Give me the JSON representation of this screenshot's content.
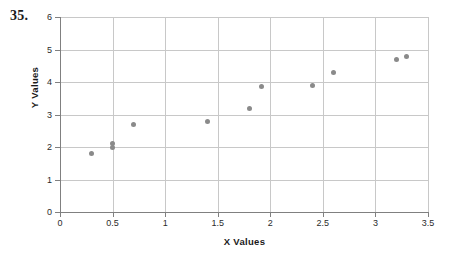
{
  "problem": {
    "number": "35."
  },
  "chart_data": {
    "type": "scatter",
    "title": "",
    "xlabel": "X Values",
    "ylabel": "Y Values",
    "xlim": [
      0,
      3.5
    ],
    "ylim": [
      0,
      6
    ],
    "grid": true,
    "legend": null,
    "marker_color": "#8a8a8a",
    "gridline_color": "#c8c8c8",
    "axis_color": "#808080",
    "xticks": [
      "0",
      "0.5",
      "1",
      "1.5",
      "2",
      "2.5",
      "3",
      "3.5"
    ],
    "xtick_values": [
      0,
      0.5,
      1,
      1.5,
      2,
      2.5,
      3,
      3.5
    ],
    "yticks": [
      "0",
      "1",
      "2",
      "3",
      "4",
      "5",
      "6"
    ],
    "ytick_values": [
      0,
      1,
      2,
      3,
      4,
      5,
      6
    ],
    "points": [
      {
        "x": 0.3,
        "y": 1.8
      },
      {
        "x": 0.5,
        "y": 2.0
      },
      {
        "x": 0.5,
        "y": 2.12
      },
      {
        "x": 0.7,
        "y": 2.7
      },
      {
        "x": 1.4,
        "y": 2.8
      },
      {
        "x": 1.8,
        "y": 3.2
      },
      {
        "x": 1.92,
        "y": 3.85
      },
      {
        "x": 2.4,
        "y": 3.9
      },
      {
        "x": 2.6,
        "y": 4.3
      },
      {
        "x": 3.2,
        "y": 4.7
      },
      {
        "x": 3.3,
        "y": 4.8
      }
    ]
  }
}
